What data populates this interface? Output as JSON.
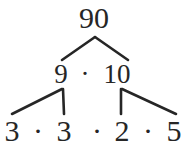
{
  "diagram": {
    "type": "factor-tree",
    "stroke_color": "#262626",
    "text_color": "#262626",
    "background_color": "#ffffff",
    "root": {
      "label": "90",
      "x": 94,
      "y": 18
    },
    "level1": {
      "left": {
        "label": "9",
        "x": 61,
        "y": 74
      },
      "operator": {
        "label": "·",
        "x": 85,
        "y": 74
      },
      "right": {
        "label": "10",
        "x": 117,
        "y": 74
      }
    },
    "level2": {
      "items": [
        {
          "label": "3",
          "x": 12,
          "y": 131
        },
        {
          "label": "·",
          "x": 38,
          "y": 131
        },
        {
          "label": "3",
          "x": 64,
          "y": 131
        },
        {
          "label": "·",
          "x": 97,
          "y": 131
        },
        {
          "label": "2",
          "x": 122,
          "y": 131
        },
        {
          "label": "·",
          "x": 148,
          "y": 131
        },
        {
          "label": "5",
          "x": 174,
          "y": 131
        }
      ]
    },
    "edges": [
      {
        "name": "root-to-9",
        "x1": 95,
        "y1": 37,
        "x2": 62,
        "y2": 60
      },
      {
        "name": "root-to-10",
        "x1": 95,
        "y1": 37,
        "x2": 128,
        "y2": 60
      },
      {
        "name": "nine-to-3a",
        "x1": 62,
        "y1": 89,
        "x2": 12,
        "y2": 114
      },
      {
        "name": "nine-to-3b",
        "x1": 63,
        "y1": 89,
        "x2": 64,
        "y2": 114
      },
      {
        "name": "ten-to-2",
        "x1": 121,
        "y1": 89,
        "x2": 121,
        "y2": 114
      },
      {
        "name": "ten-to-5",
        "x1": 122,
        "y1": 89,
        "x2": 176,
        "y2": 114
      }
    ],
    "equation": "90 = 9 · 10 = 3 · 3 · 2 · 5"
  }
}
